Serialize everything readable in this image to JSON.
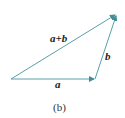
{
  "diagram": {
    "type": "vector-addition-triangle",
    "colors": {
      "vector": "#5aa0a8",
      "arrowhead": "#3f8e98",
      "text": "#222222"
    },
    "vectors": [
      {
        "id": "a",
        "label": "a",
        "from": [
          11,
          79
        ],
        "to": [
          95,
          79
        ]
      },
      {
        "id": "b",
        "label": "b",
        "from": [
          95,
          79
        ],
        "to": [
          117,
          14
        ]
      },
      {
        "id": "sum",
        "label": "a+b",
        "from": [
          11,
          79
        ],
        "to": [
          117,
          14
        ]
      }
    ],
    "labels": {
      "sum": "a+b",
      "b": "b",
      "a": "a"
    },
    "caption": "(b)"
  }
}
